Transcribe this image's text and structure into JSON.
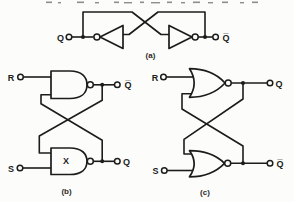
{
  "page": {
    "background": "#fcfcfa",
    "ink": "#1c1c1c"
  },
  "figure": {
    "circuit_a": {
      "caption": "(a)",
      "gate_type": "cross-coupled-inverters",
      "output_left": "Q",
      "output_right": "Q̅"
    },
    "circuit_b": {
      "caption": "(b)",
      "gate_type": "nand-sr-latch",
      "input_top": "R",
      "input_bottom": "S",
      "output_top": "Q̅",
      "output_bottom": "Q",
      "gate_mark": "X"
    },
    "circuit_c": {
      "caption": "(c)",
      "gate_type": "nor-sr-latch",
      "input_top": "R",
      "input_bottom": "S",
      "output_top": "Q",
      "output_bottom": "Q̅"
    }
  }
}
